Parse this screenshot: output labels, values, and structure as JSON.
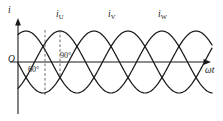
{
  "figure": {
    "type": "three-phase-current-waveform-diagram",
    "axes": {
      "y_label": "i",
      "x_label": "ωt",
      "origin_label": "O"
    },
    "curve_labels": [
      {
        "name": "i-u-label",
        "base": "i",
        "sub": "U",
        "x": 56,
        "y": 10
      },
      {
        "name": "i-v-label",
        "base": "i",
        "sub": "V",
        "x": 108,
        "y": 10
      },
      {
        "name": "i-w-label",
        "base": "i",
        "sub": "W",
        "x": 158,
        "y": 10
      }
    ],
    "angle_annotations": [
      {
        "name": "angle-60",
        "text": "60°",
        "x": 28,
        "y": 66
      },
      {
        "name": "angle-90",
        "text": "90°",
        "x": 60,
        "y": 52
      }
    ],
    "colors": {
      "stroke": "#1a1a1a",
      "background": "#ffffff",
      "dash": "#555555"
    }
  },
  "chart_data": {
    "type": "line",
    "title": "",
    "xlabel": "ωt",
    "ylabel": "i",
    "grid": false,
    "legend": "inline-above-peaks",
    "axis_baseline_y": 62,
    "amplitude_px": 31,
    "x_start": 18,
    "x_end": 212,
    "period_px": 102,
    "phase_offsets_deg": [
      0,
      -120,
      -240
    ],
    "series": [
      {
        "name": "i_U",
        "label": "iU",
        "phase_deg": 0,
        "peak_x": 60,
        "amplitude": 1.0,
        "zero_crossing_rising_x": 34
      },
      {
        "name": "i_V",
        "label": "iV",
        "phase_deg": -120,
        "peak_x": 94,
        "amplitude": 1.0,
        "zero_crossing_rising_x": 68
      },
      {
        "name": "i_W",
        "label": "iW",
        "phase_deg": -240,
        "peak_x": 128,
        "amplitude": 1.0,
        "zero_crossing_rising_x": 102
      }
    ],
    "markers": [
      {
        "name": "dashed-60-degree",
        "x": 45,
        "y_top": 30,
        "y_bottom": 96,
        "style": "dashed"
      },
      {
        "name": "dashed-90-degree",
        "x": 60,
        "y_top": 30,
        "y_bottom": 76,
        "style": "dashed"
      }
    ],
    "annotations": [
      "60°",
      "90°",
      "O",
      "i",
      "ωt",
      "iU",
      "iV",
      "iW"
    ]
  }
}
